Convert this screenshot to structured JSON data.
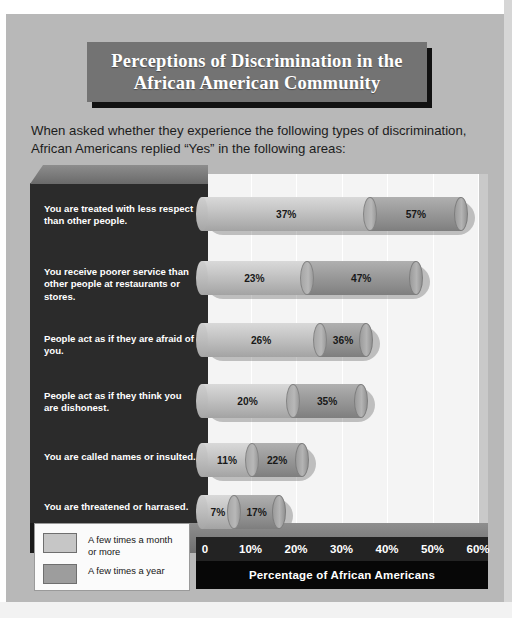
{
  "title": "Perceptions of Discrimination in the\nAfrican American Community",
  "subtitle": "When asked whether they experience the following types of discrimination,\nAfrican Americans replied “Yes” in the following areas:",
  "colors": {
    "page_background": "#b8b8b8",
    "title_banner": "#737373",
    "title_text": "#ffffff",
    "category_panel": "#2b2b2b",
    "plot_background": "#f4f4f4",
    "series_a": "#c6c6c6",
    "series_b": "#9d9d9d",
    "axis_strip": "#232323",
    "axis_caption_bar": "#070707"
  },
  "legend": {
    "items": [
      {
        "label": "A few times a month\nor more",
        "swatch": "#c6c6c6"
      },
      {
        "label": "A few times a year",
        "swatch": "#9d9d9d"
      }
    ]
  },
  "axis": {
    "caption": "Percentage of African Americans",
    "ticks": [
      "0",
      "10%",
      "20%",
      "30%",
      "40%",
      "50%",
      "60%"
    ]
  },
  "chart_data": {
    "type": "bar",
    "orientation": "horizontal",
    "stacked": true,
    "title": "Perceptions of Discrimination in the African American Community",
    "subtitle": "When asked whether they experience the following types of discrimination, African Americans replied “Yes” in the following areas:",
    "xlabel": "Percentage of African Americans",
    "ylabel": "",
    "xlim": [
      0,
      60
    ],
    "xticks": [
      0,
      10,
      20,
      30,
      40,
      50,
      60
    ],
    "xticklabels": [
      "0",
      "10%",
      "20%",
      "30%",
      "40%",
      "50%",
      "60%"
    ],
    "grid": "vertical",
    "legend_position": "bottom-left",
    "categories": [
      "You are treated with less respect than other people.",
      "You receive poorer service than other people at restaurants or stores.",
      "People act as if they are afraid of you.",
      "People act as if they think you are dishonest.",
      "You are called names or insulted.",
      "You are threatened or harrased."
    ],
    "series": [
      {
        "name": "A few times a month or more",
        "values": [
          37,
          23,
          26,
          20,
          11,
          7
        ],
        "labels": [
          "37%",
          "23%",
          "26%",
          "20%",
          "11%",
          "7%"
        ],
        "color": "#c6c6c6"
      },
      {
        "name": "A few times a year",
        "values": [
          57,
          47,
          36,
          35,
          22,
          17
        ],
        "labels": [
          "57%",
          "47%",
          "36%",
          "35%",
          "22%",
          "17%"
        ],
        "color": "#9d9d9d",
        "note": "cumulative total shown at segment end"
      }
    ],
    "bars": [
      {
        "category": "You are treated with less respect than other people.",
        "a": 37,
        "total": 57,
        "a_label": "37%",
        "total_label": "57%"
      },
      {
        "category": "You receive poorer service than other people at restaurants or stores.",
        "a": 23,
        "total": 47,
        "a_label": "23%",
        "total_label": "47%"
      },
      {
        "category": "People act as if they are afraid of you.",
        "a": 26,
        "total": 36,
        "a_label": "26%",
        "total_label": "36%"
      },
      {
        "category": "People act as if they think you are dishonest.",
        "a": 20,
        "total": 35,
        "a_label": "20%",
        "total_label": "35%"
      },
      {
        "category": "You are called names or insulted.",
        "a": 11,
        "total": 22,
        "a_label": "11%",
        "total_label": "22%"
      },
      {
        "category": "You are threatened or harrased.",
        "a": 7,
        "total": 17,
        "a_label": "7%",
        "total_label": "17%"
      }
    ]
  }
}
